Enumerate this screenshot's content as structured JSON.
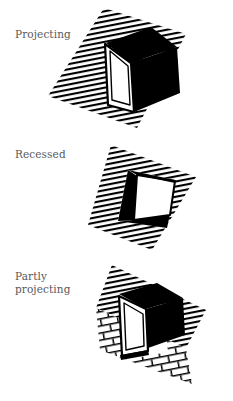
{
  "document": {
    "title": "Window placement relative to roof plane",
    "background_color": "#ffffff",
    "ink_color": "#000000",
    "label_color": "#58585a"
  },
  "figures": [
    {
      "id": "projecting",
      "label": "Projecting",
      "caption_lines": [
        "Projecting"
      ],
      "description": "Window box projecting outward from a hatched roof slope; dark top and side faces visible, white glazed face.",
      "surface": "hatched-roof",
      "window_face_color": "#ffffff",
      "shadow_face_color": "#000000"
    },
    {
      "id": "recessed",
      "label": "Recessed",
      "caption_lines": [
        "Recessed"
      ],
      "description": "Window set back into a hatched roof slope; dark reveal on the left side and dark sill below, white glazed face.",
      "surface": "hatched-roof",
      "window_face_color": "#ffffff",
      "shadow_face_color": "#000000"
    },
    {
      "id": "partly-projecting",
      "label": "Partly\nprojecting",
      "caption_lines": [
        "Partly",
        "projecting"
      ],
      "description": "Window partly projecting from a brick wall below a hatched roof slope; dark head and side return visible, white glazed face.",
      "surface": "brick-wall-and-hatched-roof",
      "window_face_color": "#ffffff",
      "shadow_face_color": "#000000"
    }
  ],
  "rendering": {
    "hatch_line_color": "#000000",
    "hatch_spacing_px": 5,
    "hatch_angle_deg": -11,
    "brick_line_color": "#000000",
    "brick_course_height_px": 7,
    "brick_length_px": 17
  }
}
